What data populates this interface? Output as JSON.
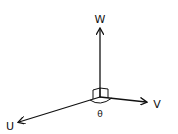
{
  "diagram": {
    "title": "",
    "type": "3D coordinate axes",
    "origin": {
      "x": 100,
      "y": 97
    },
    "axes": [
      {
        "id": "w",
        "label": "W",
        "tip": {
          "x": 100,
          "y": 28
        },
        "label_pos": {
          "x": 100,
          "y": 23
        }
      },
      {
        "id": "v",
        "label": "V",
        "tip": {
          "x": 147,
          "y": 102
        },
        "label_pos": {
          "x": 157,
          "y": 108
        }
      },
      {
        "id": "u",
        "label": "U",
        "tip": {
          "x": 18,
          "y": 123
        },
        "label_pos": {
          "x": 10,
          "y": 130
        }
      }
    ],
    "angle_label": "θ",
    "right_angle_marker": true,
    "colors": {
      "stroke": "#111111",
      "background": "#ffffff"
    }
  }
}
